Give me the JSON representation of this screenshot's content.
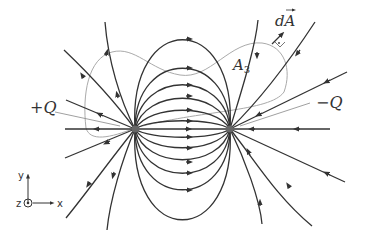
{
  "diagram": {
    "labels": {
      "positive_charge": "+Q",
      "negative_charge": "−Q",
      "area_element": "dA",
      "surface": "A",
      "surface_subscript": "3"
    },
    "axes": {
      "x": "x",
      "y": "y",
      "z": "z"
    },
    "charges": [
      {
        "name": "positive",
        "label": "+Q",
        "x": 135,
        "y": 129
      },
      {
        "name": "negative",
        "label": "−Q",
        "x": 230,
        "y": 129
      }
    ],
    "colors": {
      "field_lines": "#333333",
      "surface": "#aaaaaa",
      "background": "#ffffff"
    }
  }
}
